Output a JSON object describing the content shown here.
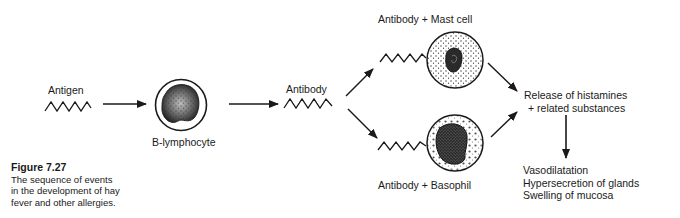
{
  "labels": {
    "antigen": "Antigen",
    "b_lymphocyte": "B-lymphocyte",
    "antibody": "Antibody",
    "antibody_mast_cell": "Antibody + Mast cell",
    "antibody_basophil": "Antibody + Basophil",
    "release": [
      "Release of histamines",
      "+ related substances"
    ],
    "effects": [
      "Vasodilatation",
      "Hypersecretion of glands",
      "Swelling of mucosa"
    ]
  },
  "caption": {
    "number": "Figure 7.27",
    "text": [
      "The sequence of events",
      "in the development of hay",
      "fever and other allergies."
    ]
  },
  "colors": {
    "ink": "#1a1a1a",
    "background": "#ffffff"
  }
}
